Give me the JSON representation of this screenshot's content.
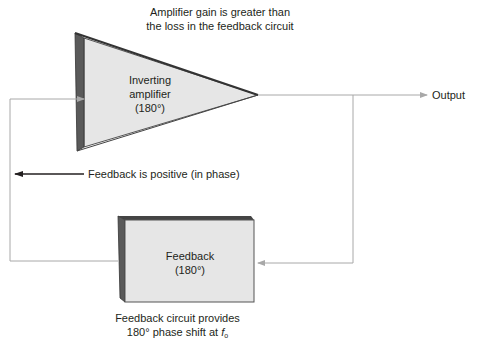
{
  "diagram": {
    "title_note": {
      "line1": "Amplifier gain is greater than",
      "line2": "the loss in the feedback circuit"
    },
    "amplifier": {
      "shape": "triangle-3d",
      "line1": "Inverting",
      "line2": "amplifier",
      "line3": "(180°)"
    },
    "feedback_block": {
      "shape": "box-3d",
      "line1": "Feedback",
      "line2": "(180°)"
    },
    "output_label": "Output",
    "loop_note": "Feedback is positive (in phase)",
    "bottom_note": {
      "line1": "Feedback circuit provides",
      "line2_prefix": "180° phase shift at ",
      "line2_var": "f",
      "line2_sub": "o"
    },
    "connections": [
      {
        "from": "amplifier",
        "to": "output",
        "label": "Output"
      },
      {
        "from": "output-junction",
        "to": "feedback_block"
      },
      {
        "from": "feedback_block",
        "to": "amplifier",
        "label": "Feedback is positive (in phase)"
      }
    ],
    "colors": {
      "face_light": "#e6e6e6",
      "face_dark": "#5a5a5a",
      "edge_dark": "#333333",
      "wire": "#a8a8a8",
      "text": "#231f20",
      "arrow_black": "#231f20"
    }
  }
}
